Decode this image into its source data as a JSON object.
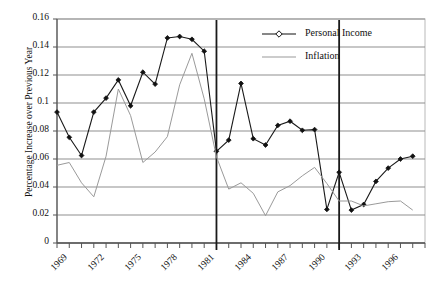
{
  "chart_data": {
    "type": "line",
    "title": "",
    "xlabel": "",
    "ylabel": "Percentage Increase over Previous Year",
    "ylim": [
      0,
      0.16
    ],
    "ytick_labels": [
      "0",
      "0.02",
      "0.04",
      "0.06",
      "0.08",
      "0.1",
      "0.12",
      "0.14",
      "0.16"
    ],
    "ytick_values": [
      0,
      0.02,
      0.04,
      0.06,
      0.08,
      0.1,
      0.12,
      0.14,
      0.16
    ],
    "xlim": [
      1969,
      1999
    ],
    "xtick_labels": [
      "1969",
      "1972",
      "1975",
      "1978",
      "1981",
      "1984",
      "1987",
      "1990",
      "1993",
      "1996"
    ],
    "xtick_values": [
      1969,
      1972,
      1975,
      1978,
      1981,
      1984,
      1987,
      1990,
      1993,
      1996
    ],
    "grid": "horizontal",
    "legend_position": "top-right",
    "x": [
      1969,
      1970,
      1971,
      1972,
      1973,
      1974,
      1975,
      1976,
      1977,
      1978,
      1979,
      1980,
      1981,
      1982,
      1983,
      1984,
      1985,
      1986,
      1987,
      1988,
      1989,
      1990,
      1991,
      1992,
      1993,
      1994,
      1995,
      1996,
      1997,
      1998
    ],
    "series": [
      {
        "name": "Personal Income",
        "color": "#1a1a1a",
        "marker": "diamond",
        "values": [
          0.0935,
          0.0755,
          0.0625,
          0.0935,
          0.1035,
          0.1165,
          0.098,
          0.122,
          0.1135,
          0.1465,
          0.1475,
          0.1455,
          0.137,
          0.0655,
          0.0735,
          0.114,
          0.0745,
          0.07,
          0.084,
          0.087,
          0.0805,
          0.081,
          0.024,
          0.0505,
          0.0235,
          0.0275,
          0.044,
          0.0535,
          0.06,
          0.062
        ]
      },
      {
        "name": "Inflation",
        "color": "#9a9a9a",
        "marker": "none",
        "values": [
          0.0555,
          0.0575,
          0.043,
          0.033,
          0.062,
          0.11,
          0.091,
          0.0575,
          0.065,
          0.076,
          0.113,
          0.1355,
          0.103,
          0.0615,
          0.0385,
          0.043,
          0.0355,
          0.0195,
          0.0365,
          0.041,
          0.048,
          0.054,
          0.0425,
          0.03,
          0.03,
          0.0265,
          0.028,
          0.0295,
          0.03,
          0.0235
        ]
      }
    ],
    "annotations": [
      {
        "type": "vertical-line",
        "x": 1982,
        "color": "#1a1a1a",
        "name": "marker-line-1982"
      },
      {
        "type": "vertical-line",
        "x": 1992,
        "color": "#1a1a1a",
        "name": "marker-line-1992"
      }
    ]
  },
  "legend": {
    "items": [
      {
        "label": "Personal Income"
      },
      {
        "label": "Inflation"
      }
    ]
  }
}
